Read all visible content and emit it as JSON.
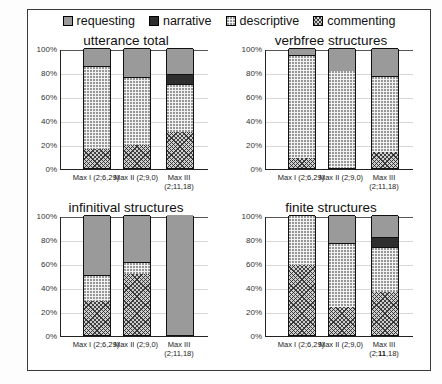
{
  "legend": {
    "items": [
      {
        "label": "requesting",
        "key": "requesting",
        "swatch": "requesting-swatch",
        "color": "#9a9a9a"
      },
      {
        "label": "narrative",
        "key": "narrative",
        "swatch": "narrative-swatch",
        "color": "#2e2e2e"
      },
      {
        "label": "descriptive",
        "key": "descriptive",
        "swatch": "descriptive-swatch",
        "color": "#f2f2f2"
      },
      {
        "label": "commenting",
        "key": "commenting",
        "swatch": "commenting-swatch",
        "color": "#cfcfcf"
      }
    ]
  },
  "axis": {
    "yticks": [
      "0%",
      "20%",
      "40%",
      "60%",
      "80%",
      "100%"
    ],
    "ytickvalues": [
      0,
      20,
      40,
      60,
      80,
      100
    ],
    "categories": [
      "Max I  (2;6,29)",
      "Max II  (2;9,0)",
      "Max III\n(2;11,18)"
    ],
    "category_names": [
      "Max I",
      "Max II",
      "Max III"
    ],
    "category_ages": [
      "(2;6,29)",
      "(2;9,0)",
      "(2;11,18)"
    ]
  },
  "panels": [
    {
      "title": "utterance total",
      "name": "panel-utterance-total"
    },
    {
      "title": "verbfree structures",
      "name": "panel-verbfree-structures"
    },
    {
      "title": "infinitival structures",
      "name": "panel-infinitival-structures"
    },
    {
      "title": "finite structures",
      "name": "panel-finite-structures"
    }
  ],
  "chart_data": [
    {
      "type": "bar",
      "title": "utterance total",
      "stacked": true,
      "xlabel": "",
      "ylabel": "",
      "ylim": [
        0,
        100
      ],
      "yticks": [
        0,
        20,
        40,
        60,
        80,
        100
      ],
      "grid": true,
      "legend_position": "top",
      "categories": [
        "Max I  (2;6,29)",
        "Max II  (2;9,0)",
        "Max III (2;11,18)"
      ],
      "series": [
        {
          "name": "commenting",
          "values": [
            16,
            19,
            30
          ]
        },
        {
          "name": "descriptive",
          "values": [
            69,
            57,
            40
          ]
        },
        {
          "name": "narrative",
          "values": [
            0,
            0,
            8
          ]
        },
        {
          "name": "requesting",
          "values": [
            15,
            24,
            22
          ]
        }
      ]
    },
    {
      "type": "bar",
      "title": "verbfree structures",
      "stacked": true,
      "xlabel": "",
      "ylabel": "",
      "ylim": [
        0,
        100
      ],
      "yticks": [
        0,
        20,
        40,
        60,
        80,
        100
      ],
      "grid": true,
      "legend_position": "top",
      "categories": [
        "Max I  (2;6,29)",
        "Max II  (2;9,0)",
        "Max III (2;11,18)"
      ],
      "series": [
        {
          "name": "commenting",
          "values": [
            8,
            0,
            13
          ]
        },
        {
          "name": "descriptive",
          "values": [
            86,
            81,
            64
          ]
        },
        {
          "name": "narrative",
          "values": [
            0,
            0,
            0
          ]
        },
        {
          "name": "requesting",
          "values": [
            6,
            19,
            23
          ]
        }
      ]
    },
    {
      "type": "bar",
      "title": "infinitival structures",
      "stacked": true,
      "xlabel": "",
      "ylabel": "",
      "ylim": [
        0,
        100
      ],
      "yticks": [
        0,
        20,
        40,
        60,
        80,
        100
      ],
      "grid": true,
      "legend_position": "top",
      "categories": [
        "Max I  (2;6,29)",
        "Max II  (2;9,0)",
        "Max III (2;11,18)"
      ],
      "series": [
        {
          "name": "commenting",
          "values": [
            28,
            51,
            0
          ]
        },
        {
          "name": "descriptive",
          "values": [
            22,
            10,
            0
          ]
        },
        {
          "name": "narrative",
          "values": [
            0,
            0,
            0
          ]
        },
        {
          "name": "requesting",
          "values": [
            50,
            39,
            100
          ]
        }
      ]
    },
    {
      "type": "bar",
      "title": "finite structures",
      "stacked": true,
      "xlabel": "",
      "ylabel": "",
      "ylim": [
        0,
        100
      ],
      "yticks": [
        0,
        20,
        40,
        60,
        80,
        100
      ],
      "grid": true,
      "legend_position": "top",
      "categories": [
        "Max I  (2;6,29)",
        "Max II  (2;9,0)",
        "Max III (2;11,18)"
      ],
      "series": [
        {
          "name": "commenting",
          "values": [
            58,
            23,
            36
          ]
        },
        {
          "name": "descriptive",
          "values": [
            42,
            54,
            37
          ]
        },
        {
          "name": "narrative",
          "values": [
            0,
            0,
            9
          ]
        },
        {
          "name": "requesting",
          "values": [
            0,
            23,
            18
          ]
        }
      ]
    }
  ]
}
